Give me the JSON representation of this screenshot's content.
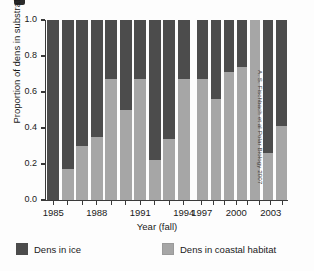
{
  "figure": {
    "credit": "A. S. Fischbach et al Polar Biology 2007"
  },
  "legend": {
    "items": [
      {
        "label": "Dens in ice",
        "color": "#4c4c4c",
        "key": "ice"
      },
      {
        "label": "Dens in coastal habitat",
        "color": "#a6a6a6",
        "key": "coastal"
      }
    ]
  },
  "chart_data": {
    "type": "bar",
    "subtype": "stacked-100-percent",
    "title": "",
    "xlabel": "Year (fall)",
    "ylabel": "Proportion of dens in substrate",
    "ylim": [
      0.0,
      1.0
    ],
    "ytick_labels": [
      "1.0",
      "0.8",
      "0.6",
      "0.4",
      "0.2",
      "0.0"
    ],
    "ytick_values": [
      1.0,
      0.8,
      0.6,
      0.4,
      0.2,
      0.0
    ],
    "xtick_labels": [
      "1985",
      "1988",
      "1991",
      "1994",
      "1997",
      "2000",
      "2003"
    ],
    "xtick_values": [
      1985,
      1988,
      1991,
      1994,
      1997,
      2000,
      2003
    ],
    "grid": false,
    "legend_position": "bottom",
    "gap_note": "No data for 1995 and 1996",
    "categories": [
      "1985",
      "1986",
      "1987",
      "1988",
      "1989",
      "1990",
      "1991",
      "1992",
      "1993",
      "1994",
      "1997",
      "1998",
      "1999",
      "2000",
      "2001",
      "2002",
      "2003",
      "2004"
    ],
    "series": [
      {
        "name": "Dens in coastal habitat",
        "color": "#a6a6a6",
        "values": [
          0.0,
          0.17,
          0.3,
          0.35,
          0.67,
          0.5,
          0.67,
          0.22,
          0.34,
          0.67,
          null,
          0.67,
          0.56,
          0.71,
          0.74,
          1.0,
          0.26,
          0.41
        ]
      },
      {
        "name": "Dens in ice",
        "color": "#4c4c4c",
        "values": [
          1.0,
          0.83,
          0.7,
          0.65,
          0.33,
          0.5,
          0.33,
          0.78,
          0.66,
          0.33,
          null,
          0.33,
          0.44,
          0.29,
          0.26,
          0.0,
          0.74,
          0.59
        ]
      }
    ],
    "groups": [
      {
        "name": "left-group",
        "categories": [
          "1985",
          "1986",
          "1987",
          "1988",
          "1989",
          "1990",
          "1991",
          "1992",
          "1993",
          "1994"
        ],
        "coastal": [
          0.0,
          0.17,
          0.3,
          0.35,
          0.67,
          0.5,
          0.67,
          0.22,
          0.34,
          0.67
        ],
        "ice": [
          1.0,
          0.83,
          0.7,
          0.65,
          0.33,
          0.5,
          0.33,
          0.78,
          0.66,
          0.33
        ]
      },
      {
        "name": "right-group",
        "categories": [
          "1997",
          "1998",
          "1999",
          "2000",
          "2001",
          "2002",
          "2003",
          "2004"
        ],
        "coastal": [
          0.67,
          0.56,
          0.71,
          0.74,
          1.0,
          0.26,
          0.41
        ],
        "ice": [
          0.33,
          0.44,
          0.29,
          0.26,
          0.0,
          0.74,
          0.59
        ]
      }
    ]
  }
}
